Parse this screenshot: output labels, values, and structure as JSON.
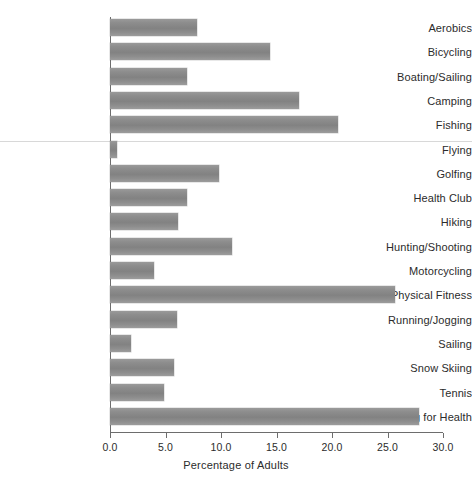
{
  "chart_data": {
    "type": "bar",
    "orientation": "horizontal",
    "title": "",
    "xlabel": "Percentage of Adults",
    "ylabel": "",
    "xlim": [
      0.0,
      30.0
    ],
    "xticks": [
      "0.0",
      "5.0",
      "10.0",
      "15.0",
      "20.0",
      "25.0",
      "30.0"
    ],
    "xtick_values": [
      0,
      5,
      10,
      15,
      20,
      25,
      30
    ],
    "grid": false,
    "legend": null,
    "bar_color": "#8a8a8a",
    "categories": [
      "Aerobics",
      "Bicycling",
      "Boating/Sailing",
      "Camping",
      "Fishing",
      "Flying",
      "Golfing",
      "Health Club",
      "Hiking",
      "Hunting/Shooting",
      "Motorcycling",
      "Physical Fitness",
      "Running/Jogging",
      "Sailing",
      "Snow Skiing",
      "Tennis",
      "Walking for Health"
    ],
    "values": [
      7.8,
      14.4,
      6.9,
      17.0,
      20.5,
      0.6,
      9.8,
      6.9,
      6.1,
      11.0,
      4.0,
      25.7,
      6.0,
      1.9,
      5.8,
      4.9,
      27.8
    ]
  }
}
